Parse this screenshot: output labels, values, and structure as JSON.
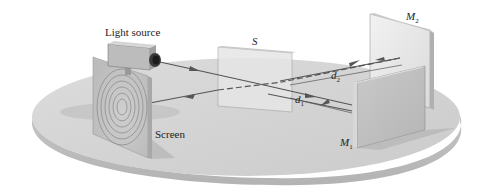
{
  "diagram": {
    "type": "michelson-interferometer",
    "labels": {
      "light_source": "Light source",
      "beam_splitter": "S",
      "mirror_2": "M",
      "mirror_2_sub": "2",
      "mirror_1": "M",
      "mirror_1_sub": "1",
      "distance_2": "d",
      "distance_2_sub": "2",
      "distance_1": "d",
      "distance_1_sub": "1",
      "screen": "Screen"
    },
    "colors": {
      "table_top": "#d2d2d2",
      "table_edge": "#bdbdbd",
      "beam": "#555555",
      "mirror_face": "#e4e4e4",
      "mirror_dark": "#a9a9a9"
    }
  }
}
